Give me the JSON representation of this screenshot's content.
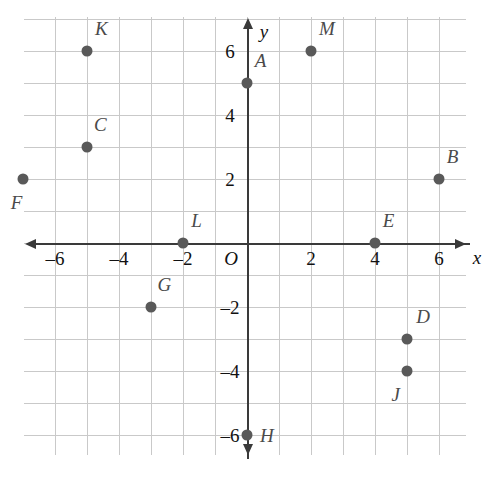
{
  "chart_data": {
    "type": "scatter",
    "title": "",
    "xlabel": "x",
    "ylabel": "y",
    "xlim": [
      -7.2,
      6.9
    ],
    "ylim": [
      -7.1,
      7.2
    ],
    "grid": true,
    "legend": "none",
    "x_ticks": [
      {
        "value": -6,
        "label": "–6"
      },
      {
        "value": -4,
        "label": "–4"
      },
      {
        "value": -2,
        "label": "–2"
      },
      {
        "value": 2,
        "label": "2"
      },
      {
        "value": 4,
        "label": "4"
      },
      {
        "value": 6,
        "label": "6"
      }
    ],
    "y_ticks": [
      {
        "value": 6,
        "label": "6"
      },
      {
        "value": 4,
        "label": "4"
      },
      {
        "value": 2,
        "label": "2"
      },
      {
        "value": -2,
        "label": "–2"
      },
      {
        "value": -4,
        "label": "–4"
      },
      {
        "value": -6,
        "label": "–6"
      }
    ],
    "origin_label": "O",
    "points": [
      {
        "name": "A",
        "x": 0,
        "y": 5,
        "label_dx": 0.42,
        "label_dy": 0.72
      },
      {
        "name": "B",
        "x": 6,
        "y": 2,
        "label_dx": 0.42,
        "label_dy": 0.72
      },
      {
        "name": "C",
        "x": -5,
        "y": 3,
        "label_dx": 0.42,
        "label_dy": 0.72
      },
      {
        "name": "D",
        "x": 5,
        "y": -3,
        "label_dx": 0.5,
        "label_dy": 0.72
      },
      {
        "name": "E",
        "x": 4,
        "y": 0,
        "label_dx": 0.42,
        "label_dy": 0.72
      },
      {
        "name": "F",
        "x": -7,
        "y": 2,
        "label_dx": -0.2,
        "label_dy": -0.72
      },
      {
        "name": "G",
        "x": -3,
        "y": -2,
        "label_dx": 0.42,
        "label_dy": 0.72
      },
      {
        "name": "H",
        "x": 0,
        "y": -6,
        "label_dx": 0.62,
        "label_dy": 0.0
      },
      {
        "name": "J",
        "x": 5,
        "y": -4,
        "label_dx": -0.35,
        "label_dy": -0.72
      },
      {
        "name": "K",
        "x": -5,
        "y": 6,
        "label_dx": 0.45,
        "label_dy": 0.72
      },
      {
        "name": "L",
        "x": -2,
        "y": 0,
        "label_dx": 0.42,
        "label_dy": 0.72
      },
      {
        "name": "M",
        "x": 2,
        "y": 6,
        "label_dx": 0.5,
        "label_dy": 0.72
      }
    ],
    "colors": {
      "point": "#595959",
      "axis": "#3a3a3a",
      "grid": "#c9c9c9",
      "label": "#4a4a4a",
      "tick": "#111111",
      "background": "#ffffff"
    }
  },
  "geometry": {
    "origin_px_x": 247,
    "origin_px_y": 243,
    "unit_px": 32,
    "grid_left_px": 24,
    "grid_top_px": 17,
    "grid_right_px": 466,
    "grid_bottom_px": 455
  }
}
